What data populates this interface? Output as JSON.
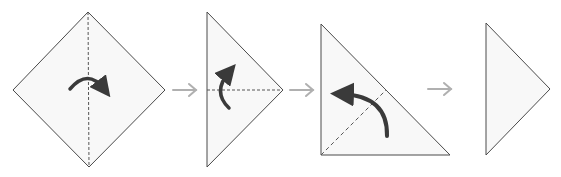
{
  "diagram": {
    "type": "origami-fold-steps",
    "caption": "",
    "colors": {
      "paper_fill": "#f8f8f8",
      "paper_stroke": "#4a4a4a",
      "fold_arrow": "#3a3a3a",
      "step_arrow": "#b0b0b0",
      "crease": "#555555"
    },
    "steps": [
      {
        "index": 1,
        "shape": "square-diamond",
        "action": "valley fold along vertical diagonal, fold left half over to the right"
      },
      {
        "index": 2,
        "shape": "right-pointing triangle",
        "action": "fold along horizontal center line, bottom up"
      },
      {
        "index": 3,
        "shape": "right triangle",
        "action": "fold along diagonal crease toward the upper left"
      },
      {
        "index": 4,
        "shape": "right-pointing triangle",
        "action": "result"
      }
    ],
    "step_arrows": 3
  }
}
